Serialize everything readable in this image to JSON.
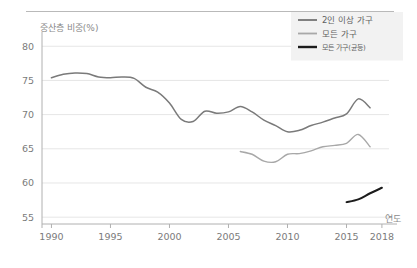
{
  "chart_data": {
    "type": "line",
    "title": "",
    "ylabel": "중산층 비중(%)",
    "xlabel": "연도",
    "ylim": [
      54,
      81.5
    ],
    "xlim": [
      1989.2,
      2018.6
    ],
    "yticks": [
      55,
      60,
      65,
      70,
      75,
      80
    ],
    "xticks": [
      1990,
      1995,
      2000,
      2005,
      2010,
      2015,
      2018
    ],
    "grid": "horizontal",
    "legend_position": "top-right",
    "series": [
      {
        "name": "2인 이상 가구",
        "color": "#7a7a7a",
        "width": 1.5,
        "x": [
          1990,
          1991,
          1992,
          1993,
          1994,
          1995,
          1996,
          1997,
          1998,
          1999,
          2000,
          2001,
          2002,
          2003,
          2004,
          2005,
          2006,
          2007,
          2008,
          2009,
          2010,
          2011,
          2012,
          2013,
          2014,
          2015,
          2016,
          2017
        ],
        "values": [
          75.4,
          75.9,
          76.1,
          76.0,
          75.5,
          75.4,
          75.5,
          75.3,
          74.0,
          73.3,
          71.7,
          69.3,
          69.0,
          70.5,
          70.2,
          70.4,
          71.2,
          70.4,
          69.2,
          68.4,
          67.5,
          67.7,
          68.4,
          68.9,
          69.5,
          70.1,
          72.3,
          71.0
        ]
      },
      {
        "name": "모든 가구",
        "color": "#a8a8a8",
        "width": 1.4,
        "x": [
          2006,
          2007,
          2008,
          2009,
          2010,
          2011,
          2012,
          2013,
          2014,
          2015,
          2016,
          2017
        ],
        "values": [
          64.6,
          64.2,
          63.2,
          63.1,
          64.2,
          64.3,
          64.7,
          65.3,
          65.5,
          65.8,
          67.1,
          65.3
        ]
      },
      {
        "name": "모든 가구(균등)",
        "color": "#1c1c1c",
        "width": 2.0,
        "x": [
          2015,
          2016,
          2017,
          2018
        ],
        "values": [
          57.2,
          57.6,
          58.5,
          59.3
        ]
      }
    ]
  },
  "legend": {
    "items": [
      {
        "label": "2인 이상 가구"
      },
      {
        "label": "모든 가구"
      },
      {
        "label": "모든 가구(균등)"
      }
    ]
  }
}
